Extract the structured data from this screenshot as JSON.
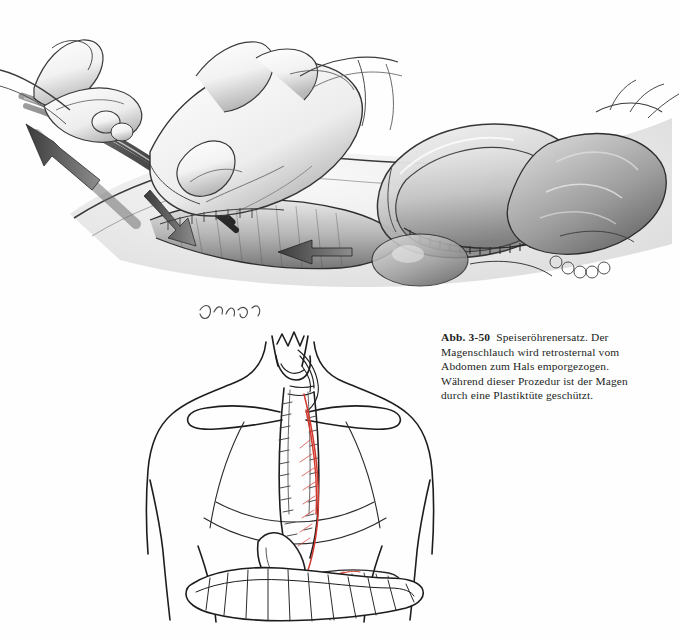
{
  "page": {
    "background": "#ffffff",
    "language": "de",
    "ink_color": "#231f1d",
    "accent_color": "#d2392f"
  },
  "caption": {
    "label": "Abb. 3-50",
    "text": "Speiseröhrenersatz. Der Magenschlauch wird retrosternal vom Abdomen zum Hals emporgezogen. Während dieser Prozedur ist der Magen durch eine Plastiktüte geschützt."
  },
  "figures": [
    {
      "id": "figure-upper",
      "name": "intraoperative-retrosternal-pull-through",
      "style": "graphite-pencil-rendering",
      "elements": [
        {
          "name": "surgeon-gloved-hand-left",
          "description": "gloved hand grasping clamp handle"
        },
        {
          "name": "surgical-clamp",
          "description": "long curved clamp entering retrosternal tunnel"
        },
        {
          "name": "traction-arrow-upper-left",
          "direction": "up-left",
          "description": "direction of clamp traction"
        },
        {
          "name": "surgeon-gloved-hand-right",
          "description": "gloved hand retracting tissue over abdomen"
        },
        {
          "name": "traction-arrow-center",
          "direction": "left",
          "description": "direction of gastric tube advancement"
        },
        {
          "name": "plastic-bag",
          "description": "plastic bag protecting the gastric tube"
        },
        {
          "name": "gastric-tube",
          "description": "tubular stomach inside the bag with staple line"
        },
        {
          "name": "staple-line",
          "description": "running staple suture along greater curvature"
        },
        {
          "name": "omentum-and-bowel",
          "description": "omentum and intestinal loops in the wound"
        },
        {
          "name": "abdominal-wall-incision",
          "description": "midline laparotomy edges"
        }
      ],
      "artist_signature": "Jaimes"
    },
    {
      "id": "figure-lower",
      "name": "anterior-torso-route-schematic",
      "style": "line-drawing-with-red-vascular-pedicle",
      "elements": [
        {
          "name": "neck-larynx",
          "description": "thyroid cartilage and larynx outline"
        },
        {
          "name": "cervical-anastomosis",
          "description": "anastomosis of gastric tube in the neck"
        },
        {
          "name": "clavicle-left",
          "description": "left clavicle outline"
        },
        {
          "name": "clavicle-right",
          "description": "right clavicle outline"
        },
        {
          "name": "sternum-retrosternal-tunnel",
          "description": "retrosternal route of the gastric tube"
        },
        {
          "name": "rib-cage",
          "description": "costal margin outlines"
        },
        {
          "name": "gastric-tube-route",
          "description": "gastric tube running from abdomen to neck"
        },
        {
          "name": "vascular-pedicle",
          "description": "right gastroepiploic vascular pedicle drawn in red",
          "color": "#d2392f"
        },
        {
          "name": "stomach-remnant",
          "description": "remaining stomach in upper abdomen"
        },
        {
          "name": "transverse-colon",
          "description": "haustrated transverse colon"
        },
        {
          "name": "greater-omentum",
          "description": "fan-shaped omentum"
        },
        {
          "name": "torso-outline",
          "description": "shoulders, arms and flanks outline"
        }
      ]
    }
  ]
}
